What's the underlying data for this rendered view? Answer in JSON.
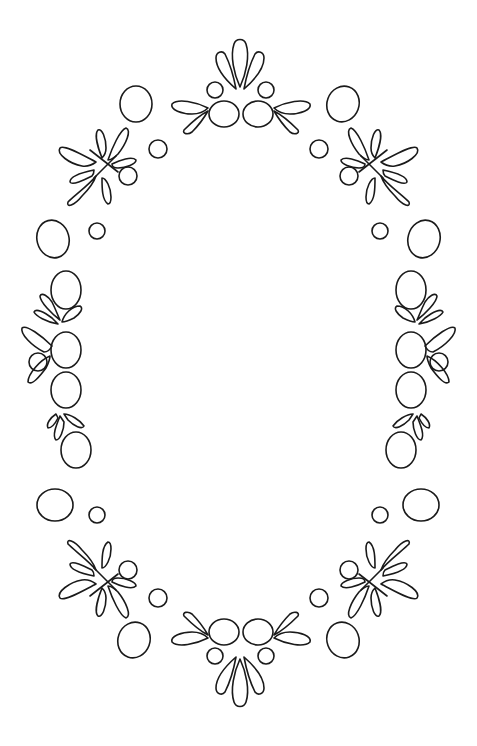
{
  "artwork": {
    "subject": "Oval ornamental frame line art",
    "style": "black outline on white",
    "colors": {
      "stroke": "#1a1a1a",
      "background": "#ffffff"
    },
    "motifs": {
      "top_crest": "three-petal leaf cluster with two large ovals and two small circles",
      "bottom_crest": "mirrored three-petal leaf cluster with two large ovals and two small circles",
      "corner_sprays": "four diagonal leaf sprays with a small circle",
      "side_clusters": "two vertical clusters of three ovals with leaves and a small circle",
      "loose_ovals": "scattered single ovals and small circles around the frame"
    }
  }
}
